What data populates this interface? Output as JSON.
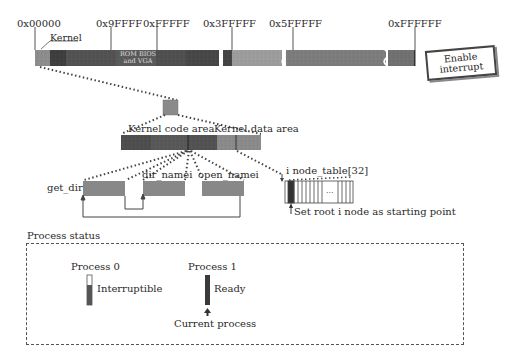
{
  "memory_map": {
    "addresses": [
      {
        "label": "0x00000",
        "x": 34
      },
      {
        "label": "0x9FFFF",
        "x": 111
      },
      {
        "label": "0xFFFFF",
        "x": 157
      },
      {
        "label": "0x3FFFFF",
        "x": 232
      },
      {
        "label": "0x5FFFFF",
        "x": 293
      },
      {
        "label": "0xFFFFFF",
        "x": 415
      }
    ],
    "kernel_label": "Kernel",
    "rom_bios_line1": "ROM BIOS",
    "rom_bios_line2": "and VGA",
    "colors": {
      "kernel": "#8a8a8a",
      "low_memory": "#4a4a4a",
      "buffer": "#5a5a5a",
      "main_mem_1": "#9a9a9a",
      "main_mem_2": "#7a7a7a",
      "main_mem_3": "#6e6e6e"
    }
  },
  "interrupt_box": {
    "line1": "Enable",
    "line2": "interrupt"
  },
  "kernel_detail": {
    "code_area_label": "Kernel code area",
    "data_area_label": "Kernel data area"
  },
  "functions": {
    "get_dir": "get_dir",
    "dir_namei": "dir_namei",
    "open_namei": "open_namei"
  },
  "inode_table": {
    "label": "i node_table[32]",
    "ellipsis": "...",
    "note": "Set root i node as starting point"
  },
  "process_status": {
    "title": "Process status",
    "processes": [
      {
        "name": "Process 0",
        "state": "Interruptible"
      },
      {
        "name": "Process 1",
        "state": "Ready"
      }
    ],
    "current_label": "Current process"
  }
}
